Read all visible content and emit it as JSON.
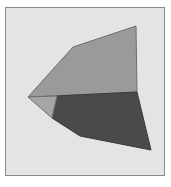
{
  "diagram": {
    "type": "polygon-figure",
    "frame": {
      "x": 5,
      "y": 7,
      "width": 160,
      "height": 169,
      "fill": "#e4e4e4",
      "stroke": "#8a8a8a"
    },
    "shapes": [
      {
        "name": "upper-light-face",
        "points": "28,97 73,47 136,26 137,92",
        "fill": "#9a9a9a",
        "stroke": "#6e6e6e"
      },
      {
        "name": "lower-dark-face",
        "points": "57,96 137,92 151,150 80,136 52,118",
        "fill": "#4a4a4a",
        "stroke": "#3a3a3a"
      },
      {
        "name": "left-small-face",
        "points": "28,97 57,96 52,118",
        "fill": "#a6a6a6",
        "stroke": "#6e6e6e"
      }
    ]
  }
}
